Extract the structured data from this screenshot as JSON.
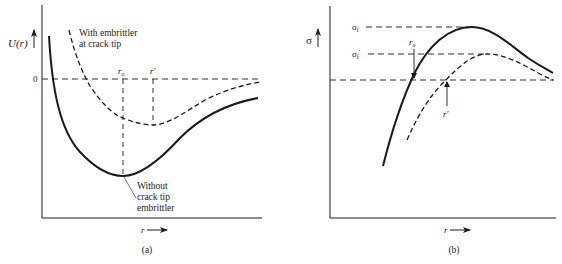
{
  "panel_a": {
    "y_axis_label": "U(r)",
    "x_axis_label": "r",
    "zero_label": "0",
    "r0_label": "r",
    "r0_sub": "o",
    "rprime_label": "r′",
    "dashed_curve_label_line1": "With embrittler",
    "dashed_curve_label_line2": "at crack tip",
    "solid_curve_label_line1": "Without",
    "solid_curve_label_line2": "crack tip",
    "solid_curve_label_line3": "embrittler",
    "caption": "(a)"
  },
  "panel_b": {
    "y_axis_label": "σ",
    "x_axis_label": "r",
    "sigma_f_label": "σ",
    "sigma_f_sub": "f",
    "sigma_f_prime_label": "σ",
    "sigma_f_prime_sub": "f",
    "sigma_f_prime_mark": "′",
    "r0_label": "r",
    "r0_sub": "o",
    "rprime_label": "r′",
    "caption": "(b)"
  },
  "colors": {
    "ink": "#1a1a1a",
    "background": "#ffffff"
  }
}
